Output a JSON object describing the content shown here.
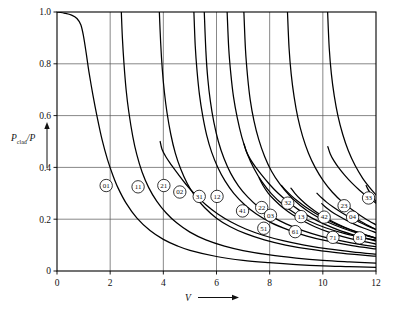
{
  "chart_data": {
    "type": "line",
    "title": "",
    "xlabel": "V",
    "ylabel": "P_clad/P",
    "ylabel_main": "P",
    "ylabel_sub": "clad",
    "ylabel_tail": "/P",
    "xlim": [
      0,
      12
    ],
    "ylim": [
      0,
      1.0
    ],
    "grid": true,
    "legend_position": "inline-curve-badges",
    "xticks": [
      0,
      2,
      4,
      6,
      8,
      10,
      12
    ],
    "xticklabels": [
      "0",
      "2",
      "4",
      "6",
      "8",
      "10",
      "12"
    ],
    "yticks": [
      0,
      0.2,
      0.4,
      0.6,
      0.8,
      1.0
    ],
    "yticklabels": [
      "0",
      "0.2",
      "0.4",
      "0.6",
      "0.8",
      "1.0"
    ],
    "series": [
      {
        "name": "01",
        "cutoff_V": 0.0,
        "label_V": 1.85,
        "label_P": 0.33,
        "points": [
          [
            0.0,
            1.0
          ],
          [
            0.3,
            0.995
          ],
          [
            0.55,
            0.988
          ],
          [
            0.75,
            0.975
          ],
          [
            0.9,
            0.95
          ],
          [
            1.0,
            0.905
          ],
          [
            1.1,
            0.84
          ],
          [
            1.2,
            0.77
          ],
          [
            1.35,
            0.68
          ],
          [
            1.5,
            0.6
          ],
          [
            1.7,
            0.505
          ],
          [
            1.9,
            0.43
          ],
          [
            2.1,
            0.37
          ],
          [
            2.3,
            0.32
          ],
          [
            2.6,
            0.262
          ],
          [
            3.0,
            0.205
          ],
          [
            3.5,
            0.156
          ],
          [
            4.0,
            0.122
          ],
          [
            4.5,
            0.098
          ],
          [
            5.0,
            0.08
          ],
          [
            6.0,
            0.056
          ],
          [
            7.0,
            0.041
          ],
          [
            8.0,
            0.032
          ],
          [
            9.0,
            0.025
          ],
          [
            10.0,
            0.02
          ],
          [
            11.0,
            0.017
          ],
          [
            12.0,
            0.014
          ]
        ]
      },
      {
        "name": "11",
        "cutoff_V": 2.405,
        "label_V": 3.05,
        "label_P": 0.325,
        "points": [
          [
            2.42,
            1.0
          ],
          [
            2.46,
            0.9
          ],
          [
            2.52,
            0.8
          ],
          [
            2.6,
            0.7
          ],
          [
            2.7,
            0.615
          ],
          [
            2.85,
            0.52
          ],
          [
            3.0,
            0.45
          ],
          [
            3.2,
            0.382
          ],
          [
            3.45,
            0.322
          ],
          [
            3.75,
            0.27
          ],
          [
            4.1,
            0.225
          ],
          [
            4.5,
            0.186
          ],
          [
            5.0,
            0.15
          ],
          [
            5.6,
            0.12
          ],
          [
            6.3,
            0.096
          ],
          [
            7.0,
            0.079
          ],
          [
            8.0,
            0.062
          ],
          [
            9.0,
            0.05
          ],
          [
            10.0,
            0.041
          ],
          [
            11.0,
            0.035
          ],
          [
            12.0,
            0.03
          ]
        ]
      },
      {
        "name": "21",
        "cutoff_V": 3.832,
        "label_V": 4.02,
        "label_P": 0.33,
        "points": [
          [
            3.85,
            1.0
          ],
          [
            3.9,
            0.88
          ],
          [
            3.96,
            0.78
          ],
          [
            4.04,
            0.69
          ],
          [
            4.14,
            0.61
          ],
          [
            4.28,
            0.528
          ],
          [
            4.45,
            0.455
          ],
          [
            4.65,
            0.395
          ],
          [
            4.9,
            0.338
          ],
          [
            5.2,
            0.288
          ],
          [
            5.55,
            0.245
          ],
          [
            6.0,
            0.204
          ],
          [
            6.5,
            0.172
          ],
          [
            7.1,
            0.144
          ],
          [
            7.8,
            0.12
          ],
          [
            8.6,
            0.1
          ],
          [
            9.5,
            0.084
          ],
          [
            10.5,
            0.071
          ],
          [
            11.5,
            0.061
          ],
          [
            12.0,
            0.057
          ]
        ]
      },
      {
        "name": "02",
        "cutoff_V": 3.832,
        "label_V": 4.62,
        "label_P": 0.305,
        "points": [
          [
            3.88,
            0.5
          ],
          [
            3.95,
            0.47
          ],
          [
            4.1,
            0.44
          ],
          [
            4.3,
            0.41
          ],
          [
            4.55,
            0.375
          ],
          [
            4.85,
            0.335
          ],
          [
            5.2,
            0.295
          ],
          [
            5.6,
            0.256
          ],
          [
            6.05,
            0.22
          ],
          [
            6.55,
            0.189
          ],
          [
            7.1,
            0.162
          ],
          [
            7.75,
            0.138
          ],
          [
            8.5,
            0.117
          ],
          [
            9.3,
            0.1
          ],
          [
            10.2,
            0.085
          ],
          [
            11.1,
            0.074
          ],
          [
            12.0,
            0.065
          ]
        ]
      },
      {
        "name": "31",
        "cutoff_V": 5.136,
        "label_V": 5.35,
        "label_P": 0.288,
        "points": [
          [
            5.15,
            1.0
          ],
          [
            5.2,
            0.87
          ],
          [
            5.27,
            0.77
          ],
          [
            5.36,
            0.68
          ],
          [
            5.48,
            0.6
          ],
          [
            5.63,
            0.525
          ],
          [
            5.82,
            0.458
          ],
          [
            6.05,
            0.4
          ],
          [
            6.32,
            0.348
          ],
          [
            6.65,
            0.3
          ],
          [
            7.05,
            0.257
          ],
          [
            7.5,
            0.22
          ],
          [
            8.05,
            0.187
          ],
          [
            8.7,
            0.159
          ],
          [
            9.4,
            0.135
          ],
          [
            10.2,
            0.115
          ],
          [
            11.1,
            0.098
          ],
          [
            12.0,
            0.085
          ]
        ]
      },
      {
        "name": "12",
        "cutoff_V": 5.52,
        "label_V": 6.02,
        "label_P": 0.288,
        "points": [
          [
            5.54,
            1.0
          ],
          [
            5.6,
            0.85
          ],
          [
            5.67,
            0.745
          ],
          [
            5.77,
            0.655
          ],
          [
            5.9,
            0.575
          ],
          [
            6.07,
            0.5
          ],
          [
            6.28,
            0.435
          ],
          [
            6.53,
            0.378
          ],
          [
            6.83,
            0.328
          ],
          [
            7.18,
            0.285
          ],
          [
            7.6,
            0.245
          ],
          [
            8.08,
            0.211
          ],
          [
            8.62,
            0.182
          ],
          [
            9.25,
            0.156
          ],
          [
            9.95,
            0.134
          ],
          [
            10.7,
            0.116
          ],
          [
            11.5,
            0.101
          ],
          [
            12.0,
            0.094
          ]
        ]
      },
      {
        "name": "41",
        "cutoff_V": 6.38,
        "label_V": 6.98,
        "label_P": 0.232,
        "points": [
          [
            6.4,
            1.0
          ],
          [
            6.46,
            0.86
          ],
          [
            6.54,
            0.76
          ],
          [
            6.64,
            0.672
          ],
          [
            6.78,
            0.592
          ],
          [
            6.95,
            0.518
          ],
          [
            7.16,
            0.452
          ],
          [
            7.42,
            0.394
          ],
          [
            7.72,
            0.343
          ],
          [
            8.07,
            0.298
          ],
          [
            8.48,
            0.258
          ],
          [
            8.95,
            0.223
          ],
          [
            9.48,
            0.193
          ],
          [
            10.1,
            0.167
          ],
          [
            10.8,
            0.145
          ],
          [
            11.4,
            0.131
          ],
          [
            12.0,
            0.119
          ]
        ]
      },
      {
        "name": "22",
        "cutoff_V": 7.016,
        "label_V": 7.7,
        "label_P": 0.245,
        "points": [
          [
            7.04,
            0.49
          ],
          [
            7.12,
            0.462
          ],
          [
            7.28,
            0.43
          ],
          [
            7.48,
            0.4
          ],
          [
            7.72,
            0.368
          ],
          [
            8.0,
            0.334
          ],
          [
            8.32,
            0.3
          ],
          [
            8.7,
            0.266
          ],
          [
            9.12,
            0.234
          ],
          [
            9.58,
            0.205
          ],
          [
            10.1,
            0.179
          ],
          [
            10.65,
            0.156
          ],
          [
            11.2,
            0.138
          ],
          [
            11.6,
            0.126
          ],
          [
            12.0,
            0.116
          ]
        ]
      },
      {
        "name": "03",
        "cutoff_V": 7.016,
        "label_V": 8.03,
        "label_P": 0.215,
        "points": [
          [
            7.03,
            1.0
          ],
          [
            7.09,
            0.855
          ],
          [
            7.17,
            0.75
          ],
          [
            7.27,
            0.66
          ],
          [
            7.41,
            0.58
          ],
          [
            7.59,
            0.507
          ],
          [
            7.81,
            0.442
          ],
          [
            8.07,
            0.385
          ],
          [
            8.38,
            0.336
          ],
          [
            8.74,
            0.292
          ],
          [
            9.15,
            0.253
          ],
          [
            9.62,
            0.219
          ],
          [
            10.15,
            0.19
          ],
          [
            10.75,
            0.165
          ],
          [
            11.4,
            0.143
          ],
          [
            12.0,
            0.127
          ]
        ]
      },
      {
        "name": "51",
        "cutoff_V": 7.588,
        "label_V": 7.78,
        "label_P": 0.165,
        "points": [
          [
            7.6,
            0.36
          ],
          [
            7.75,
            0.33
          ],
          [
            7.95,
            0.3
          ],
          [
            8.2,
            0.272
          ],
          [
            8.5,
            0.244
          ],
          [
            8.85,
            0.218
          ],
          [
            9.25,
            0.194
          ],
          [
            9.7,
            0.171
          ],
          [
            10.2,
            0.151
          ],
          [
            10.75,
            0.133
          ],
          [
            11.35,
            0.118
          ],
          [
            12.0,
            0.104
          ]
        ]
      },
      {
        "name": "32",
        "cutoff_V": 8.417,
        "label_V": 8.68,
        "label_P": 0.262,
        "points": [
          [
            8.45,
            0.33
          ],
          [
            8.6,
            0.312
          ],
          [
            8.8,
            0.292
          ],
          [
            9.05,
            0.27
          ],
          [
            9.35,
            0.247
          ],
          [
            9.7,
            0.224
          ],
          [
            10.08,
            0.202
          ],
          [
            10.5,
            0.181
          ],
          [
            10.95,
            0.162
          ],
          [
            11.45,
            0.144
          ],
          [
            12.0,
            0.127
          ]
        ]
      },
      {
        "name": "13",
        "cutoff_V": 8.654,
        "label_V": 9.18,
        "label_P": 0.21,
        "points": [
          [
            8.67,
            1.0
          ],
          [
            8.73,
            0.86
          ],
          [
            8.81,
            0.76
          ],
          [
            8.92,
            0.672
          ],
          [
            9.06,
            0.592
          ],
          [
            9.24,
            0.52
          ],
          [
            9.46,
            0.455
          ],
          [
            9.72,
            0.398
          ],
          [
            10.02,
            0.348
          ],
          [
            10.36,
            0.304
          ],
          [
            10.75,
            0.265
          ],
          [
            11.18,
            0.231
          ],
          [
            11.6,
            0.202
          ],
          [
            12.0,
            0.178
          ]
        ]
      },
      {
        "name": "61",
        "cutoff_V": 8.771,
        "label_V": 8.96,
        "label_P": 0.152,
        "points": [
          [
            8.8,
            0.32
          ],
          [
            8.95,
            0.3
          ],
          [
            9.15,
            0.278
          ],
          [
            9.4,
            0.255
          ],
          [
            9.7,
            0.232
          ],
          [
            10.03,
            0.21
          ],
          [
            10.4,
            0.189
          ],
          [
            10.8,
            0.17
          ],
          [
            11.25,
            0.152
          ],
          [
            11.65,
            0.138
          ],
          [
            12.0,
            0.126
          ]
        ]
      },
      {
        "name": "42",
        "cutoff_V": 9.761,
        "label_V": 10.05,
        "label_P": 0.208,
        "points": [
          [
            9.78,
            0.3
          ],
          [
            9.95,
            0.283
          ],
          [
            10.15,
            0.265
          ],
          [
            10.4,
            0.246
          ],
          [
            10.7,
            0.226
          ],
          [
            11.02,
            0.207
          ],
          [
            11.38,
            0.188
          ],
          [
            11.7,
            0.173
          ],
          [
            12.0,
            0.16
          ]
        ]
      },
      {
        "name": "23",
        "cutoff_V": 10.173,
        "label_V": 10.8,
        "label_P": 0.252,
        "points": [
          [
            10.19,
            0.48
          ],
          [
            10.28,
            0.452
          ],
          [
            10.42,
            0.425
          ],
          [
            10.6,
            0.398
          ],
          [
            10.82,
            0.37
          ],
          [
            11.08,
            0.341
          ],
          [
            11.38,
            0.312
          ],
          [
            11.7,
            0.285
          ],
          [
            12.0,
            0.262
          ]
        ]
      },
      {
        "name": "04",
        "cutoff_V": 10.173,
        "label_V": 11.12,
        "label_P": 0.208,
        "points": [
          [
            10.18,
            1.0
          ],
          [
            10.24,
            0.862
          ],
          [
            10.32,
            0.762
          ],
          [
            10.43,
            0.676
          ],
          [
            10.57,
            0.598
          ],
          [
            10.75,
            0.527
          ],
          [
            10.96,
            0.464
          ],
          [
            11.21,
            0.408
          ],
          [
            11.5,
            0.358
          ],
          [
            11.78,
            0.32
          ],
          [
            12.0,
            0.294
          ]
        ]
      },
      {
        "name": "71",
        "cutoff_V": 9.936,
        "label_V": 10.38,
        "label_P": 0.13,
        "points": [
          [
            9.96,
            0.26
          ],
          [
            10.12,
            0.245
          ],
          [
            10.33,
            0.229
          ],
          [
            10.58,
            0.213
          ],
          [
            10.88,
            0.196
          ],
          [
            11.2,
            0.18
          ],
          [
            11.55,
            0.165
          ],
          [
            12.0,
            0.148
          ]
        ]
      },
      {
        "name": "33",
        "cutoff_V": 11.62,
        "label_V": 11.72,
        "label_P": 0.282,
        "points": [
          [
            11.63,
            0.33
          ],
          [
            11.7,
            0.315
          ],
          [
            11.8,
            0.298
          ],
          [
            11.9,
            0.282
          ],
          [
            12.0,
            0.268
          ]
        ]
      },
      {
        "name": "81",
        "cutoff_V": 11.086,
        "label_V": 11.38,
        "label_P": 0.128,
        "points": [
          [
            11.1,
            0.215
          ],
          [
            11.25,
            0.203
          ],
          [
            11.45,
            0.19
          ],
          [
            11.68,
            0.177
          ],
          [
            11.85,
            0.168
          ],
          [
            12.0,
            0.16
          ]
        ]
      }
    ]
  },
  "plot": {
    "axis_arrow_x_label": "V",
    "axis_arrow_y_label": "P",
    "background_color": "#ffffff",
    "curve_color": "#000000",
    "grid_color": "#555555"
  }
}
